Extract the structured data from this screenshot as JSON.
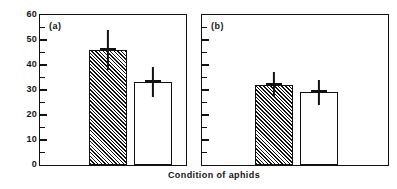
{
  "figure": {
    "ylabel": "% Aphids dropping",
    "xlabel": "Condition of aphids",
    "panel_a_label": "(a)",
    "panel_b_label": "(b)",
    "ink_color": "#111111",
    "background_color": "#ffffff"
  },
  "axis": {
    "y_tick_labels": [
      "60",
      "50",
      "40",
      "30",
      "20",
      "10",
      "0"
    ],
    "y_tick_values": [
      60,
      50,
      40,
      30,
      20,
      10,
      0
    ],
    "y_minor_tick_values": [
      55,
      45,
      35,
      25,
      15,
      5
    ]
  },
  "chart_data": {
    "type": "bar",
    "title": "",
    "xlabel": "Condition of aphids",
    "ylabel": "% Aphids dropping",
    "ylim": [
      0,
      60
    ],
    "ytick_step": 10,
    "yminor_tick_step": 5,
    "grid": false,
    "legend": "none",
    "panels": [
      {
        "label": "(a)",
        "categories": [
          "hatched",
          "open"
        ],
        "values": [
          46,
          33
        ],
        "errors": [
          8,
          6
        ],
        "bar_styles": [
          "hatched",
          "open"
        ]
      },
      {
        "label": "(b)",
        "categories": [
          "hatched",
          "open"
        ],
        "values": [
          32,
          29
        ],
        "errors": [
          5,
          5
        ],
        "bar_styles": [
          "hatched",
          "open"
        ]
      }
    ]
  }
}
